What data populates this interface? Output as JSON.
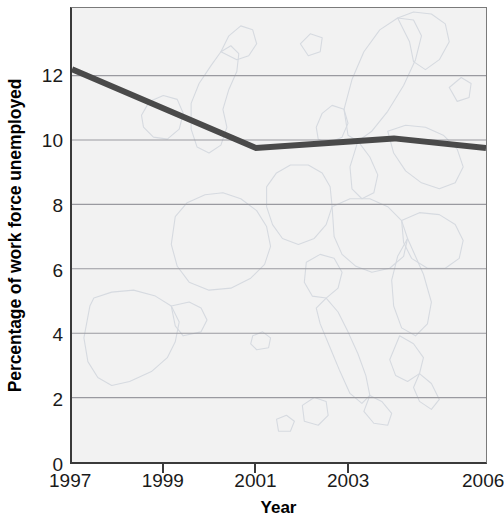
{
  "chart_data": {
    "type": "line",
    "title": "",
    "xlabel": "Year",
    "ylabel": "Percentage of work force unemployed",
    "xlim": [
      1997,
      2006
    ],
    "ylim": [
      0,
      14.1
    ],
    "grid": true,
    "legend": "none",
    "background_watermark": "map-of-europe",
    "x_tick_labels": [
      "1997",
      "1999",
      "2001",
      "2003",
      "2006"
    ],
    "x_tick_values": [
      1997,
      1999,
      2001,
      2003,
      2006
    ],
    "y_tick_labels": [
      "0",
      "2",
      "4",
      "6",
      "8",
      "10",
      "12"
    ],
    "y_tick_values": [
      0,
      2,
      4,
      6,
      8,
      10,
      12
    ],
    "series": [
      {
        "name": "Percentage of work force unemployed",
        "color": "#4a4a4a",
        "line_width": 6,
        "x": [
          1997,
          2001,
          2004,
          2006
        ],
        "values": [
          12.2,
          9.75,
          10.05,
          9.75
        ]
      }
    ]
  },
  "axes": {
    "y_title": "Percentage of work force unemployed",
    "x_title": "Year"
  },
  "style": {
    "plot_background": "#f2f2f2",
    "grid_color": "#9a9aa0",
    "axis_color": "#3a3a3a",
    "line_color": "#4a4a4a",
    "map_color": "#d9dde2",
    "text_color": "#1a1a1a"
  }
}
